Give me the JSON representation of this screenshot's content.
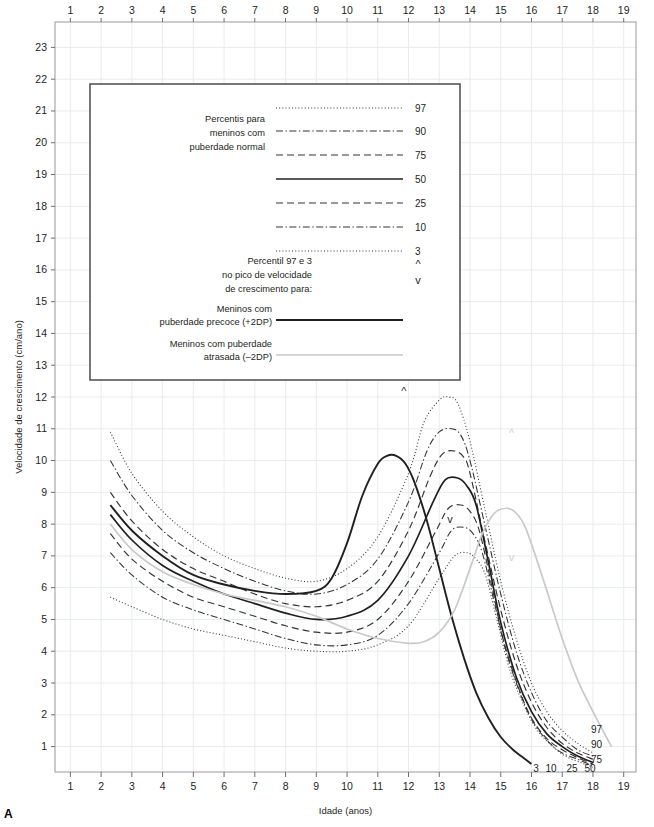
{
  "figure": {
    "panel_label": "A"
  },
  "axes": {
    "x": {
      "title": "Idade (anos)",
      "ticks": [
        1,
        2,
        3,
        4,
        5,
        6,
        7,
        8,
        9,
        10,
        11,
        12,
        13,
        14,
        15,
        16,
        17,
        18,
        19
      ],
      "min": 0.5,
      "max": 19.4
    },
    "y": {
      "title": "Velocidade de crescimento (cm/ano)",
      "ticks": [
        23,
        22,
        21,
        20,
        19,
        18,
        17,
        16,
        15,
        14,
        13,
        12,
        11,
        10,
        9,
        8,
        7,
        6,
        5,
        4,
        3,
        2,
        1
      ],
      "min": 0.2,
      "max": 23.8
    },
    "grid": true
  },
  "legend": {
    "title_normal": "Percentis para\nmeninos com\npuberdade normal",
    "title_normal_lines": [
      "Percentis para",
      "meninos com",
      "puberdade normal"
    ],
    "entries": [
      {
        "label": "97",
        "style": "dotted"
      },
      {
        "label": "90",
        "style": "dash-dot"
      },
      {
        "label": "75",
        "style": "dashed"
      },
      {
        "label": "50",
        "style": "solid"
      },
      {
        "label": "25",
        "style": "dashed"
      },
      {
        "label": "10",
        "style": "dash-dot"
      },
      {
        "label": "3",
        "style": "dotted"
      }
    ],
    "peak_title_lines": [
      "Percentil 97 e 3",
      "no pico de velocidade",
      "de crescimento para:"
    ],
    "peak_markers": {
      "up": "^",
      "down": "v"
    },
    "precoce_lines": [
      "Meninos com",
      "puberdade precoce (+2DP)"
    ],
    "atrasada_lines": [
      "Meninos com puberdade",
      "atrasada (–2DP)"
    ]
  },
  "curve_end_labels": {
    "right_stack": [
      "97",
      "90",
      "75"
    ],
    "bottom_row": [
      "3",
      "10",
      "25",
      "50"
    ]
  },
  "markers": [
    {
      "name": "precoce-97-up",
      "glyph": "^",
      "x": 11.85,
      "y": 12.05,
      "color": "#231f20"
    },
    {
      "name": "precoce-3-down",
      "glyph": "v",
      "x": 13.35,
      "y": 8.05,
      "color": "#231f20"
    },
    {
      "name": "atrasada-97-up",
      "glyph": "^",
      "x": 15.35,
      "y": 10.75,
      "color": "#cfcfcf"
    },
    {
      "name": "atrasada-3-down",
      "glyph": "v",
      "x": 15.35,
      "y": 6.85,
      "color": "#cfcfcf"
    }
  ],
  "colors": {
    "percentile": "#333333",
    "median": "#231f20",
    "precoce": "#231f20",
    "atrasada": "#c9c9c9",
    "grid": "#e9ecee",
    "frame": "#9a9a9a"
  },
  "chart_data": {
    "type": "line",
    "xlabel": "Idade (anos)",
    "ylabel": "Velocidade de crescimento (cm/ano)",
    "xlim": [
      0.5,
      19.4
    ],
    "ylim": [
      0.2,
      23.8
    ],
    "grid": true,
    "legend_position": "inset-top-left",
    "x_ticks": [
      1,
      2,
      3,
      4,
      5,
      6,
      7,
      8,
      9,
      10,
      11,
      12,
      13,
      14,
      15,
      16,
      17,
      18,
      19
    ],
    "y_ticks": [
      1,
      2,
      3,
      4,
      5,
      6,
      7,
      8,
      9,
      10,
      11,
      12,
      13,
      14,
      15,
      16,
      17,
      18,
      19,
      20,
      21,
      22,
      23
    ],
    "series": [
      {
        "name": "97",
        "style": "dotted",
        "x": [
          2.3,
          3,
          4,
          5,
          6,
          7,
          8,
          9,
          10,
          11,
          12,
          12.5,
          13,
          13.3,
          13.6,
          14,
          14.5,
          15,
          15.5,
          16,
          16.5,
          17,
          17.5,
          18
        ],
        "values": [
          10.9,
          9.6,
          8.4,
          7.6,
          7.0,
          6.6,
          6.3,
          6.2,
          6.6,
          7.6,
          9.6,
          11.2,
          11.9,
          12.0,
          11.8,
          10.6,
          8.4,
          6.2,
          4.4,
          3.0,
          2.1,
          1.5,
          1.1,
          0.8
        ]
      },
      {
        "name": "90",
        "style": "dash-dot",
        "x": [
          2.3,
          3,
          4,
          5,
          6,
          7,
          8,
          9,
          10,
          11,
          12,
          12.6,
          13,
          13.4,
          13.7,
          14,
          14.5,
          15,
          15.5,
          16,
          16.5,
          17,
          17.5,
          18
        ],
        "values": [
          10.0,
          8.9,
          7.8,
          7.1,
          6.6,
          6.2,
          5.9,
          5.8,
          6.1,
          6.9,
          8.7,
          10.3,
          10.9,
          11.0,
          10.8,
          10.0,
          7.9,
          5.8,
          4.0,
          2.7,
          1.8,
          1.3,
          0.9,
          0.7
        ]
      },
      {
        "name": "75",
        "style": "dashed",
        "x": [
          2.3,
          3,
          4,
          5,
          6,
          7,
          8,
          9,
          10,
          11,
          12,
          12.7,
          13.1,
          13.5,
          13.8,
          14,
          14.5,
          15,
          15.5,
          16,
          16.5,
          17,
          17.5,
          18
        ],
        "values": [
          9.0,
          8.1,
          7.2,
          6.6,
          6.2,
          5.8,
          5.5,
          5.4,
          5.6,
          6.2,
          7.8,
          9.5,
          10.2,
          10.3,
          10.1,
          9.6,
          7.4,
          5.3,
          3.6,
          2.4,
          1.6,
          1.1,
          0.8,
          0.6
        ]
      },
      {
        "name": "50",
        "style": "solid",
        "x": [
          2.3,
          3,
          4,
          5,
          6,
          7,
          8,
          9,
          10,
          11,
          12,
          12.8,
          13.2,
          13.6,
          13.9,
          14.2,
          14.6,
          15,
          15.5,
          16,
          16.5,
          17,
          17.5,
          18
        ],
        "values": [
          8.3,
          7.5,
          6.7,
          6.2,
          5.8,
          5.5,
          5.2,
          5.0,
          5.1,
          5.6,
          7.0,
          8.7,
          9.4,
          9.45,
          9.2,
          8.6,
          6.8,
          4.9,
          3.2,
          2.1,
          1.4,
          1.0,
          0.7,
          0.5
        ]
      },
      {
        "name": "25",
        "style": "dashed",
        "x": [
          2.3,
          3,
          4,
          5,
          6,
          7,
          8,
          9,
          10,
          11,
          12,
          12.9,
          13.3,
          13.7,
          14,
          14.3,
          14.7,
          15.1,
          15.6,
          16,
          16.5,
          17,
          17.5,
          18
        ],
        "values": [
          7.7,
          6.9,
          6.2,
          5.7,
          5.4,
          5.1,
          4.8,
          4.6,
          4.6,
          5.0,
          6.2,
          7.8,
          8.5,
          8.6,
          8.4,
          7.8,
          6.1,
          4.3,
          2.8,
          1.9,
          1.25,
          0.9,
          0.65,
          0.45
        ]
      },
      {
        "name": "10",
        "style": "dash-dot",
        "x": [
          2.3,
          3,
          4,
          5,
          6,
          7,
          8,
          9,
          10,
          11,
          12,
          13,
          13.4,
          13.8,
          14.1,
          14.4,
          14.8,
          15.2,
          15.7,
          16.1,
          16.6,
          17,
          17.5,
          18
        ],
        "values": [
          7.1,
          6.4,
          5.7,
          5.3,
          5.0,
          4.7,
          4.4,
          4.2,
          4.2,
          4.5,
          5.5,
          7.1,
          7.8,
          7.9,
          7.7,
          7.1,
          5.5,
          3.9,
          2.5,
          1.7,
          1.1,
          0.8,
          0.6,
          0.4
        ]
      },
      {
        "name": "3",
        "style": "dotted",
        "x": [
          2.3,
          3,
          4,
          5,
          6,
          7,
          8,
          9,
          10,
          11,
          12,
          13,
          13.5,
          13.9,
          14.2,
          14.5,
          14.9,
          15.3,
          15.8,
          16.2,
          16.7,
          17.1,
          17.6,
          18
        ],
        "values": [
          5.7,
          5.4,
          5.0,
          4.7,
          4.5,
          4.3,
          4.1,
          4.0,
          4.0,
          4.2,
          4.8,
          6.3,
          7.0,
          7.1,
          6.9,
          6.4,
          4.9,
          3.4,
          2.2,
          1.5,
          1.0,
          0.7,
          0.5,
          0.35
        ]
      },
      {
        "name": "puberdade precoce (+2DP)",
        "style": "solid-dark",
        "x": [
          2.3,
          3,
          4,
          5,
          6,
          7,
          8,
          9,
          9.5,
          10,
          10.5,
          11,
          11.3,
          11.6,
          11.9,
          12.2,
          12.6,
          13,
          13.4,
          13.8,
          14.2,
          14.6,
          15,
          15.4,
          15.8,
          16
        ],
        "values": [
          8.6,
          7.8,
          7.0,
          6.4,
          6.1,
          5.9,
          5.8,
          5.9,
          6.3,
          7.4,
          8.9,
          9.9,
          10.15,
          10.15,
          9.9,
          9.3,
          8.1,
          6.6,
          5.1,
          3.8,
          2.7,
          1.9,
          1.3,
          0.9,
          0.6,
          0.45
        ]
      },
      {
        "name": "puberdade atrasada (–2DP)",
        "style": "gray",
        "x": [
          2.3,
          3,
          4,
          5,
          6,
          7,
          8,
          9,
          10,
          11,
          12,
          12.5,
          13,
          13.5,
          14,
          14.4,
          14.8,
          15.2,
          15.5,
          15.8,
          16.2,
          16.6,
          17,
          17.5,
          18,
          18.6
        ],
        "values": [
          8.0,
          7.2,
          6.5,
          6.1,
          5.8,
          5.6,
          5.4,
          5.1,
          4.7,
          4.4,
          4.25,
          4.3,
          4.6,
          5.3,
          6.6,
          7.7,
          8.35,
          8.5,
          8.35,
          7.9,
          6.8,
          5.6,
          4.4,
          3.1,
          2.1,
          1.0
        ]
      }
    ],
    "annotations": [
      {
        "text": "^",
        "x": 11.85,
        "y": 12.05,
        "meaning": "percentil 97 no pico, puberdade precoce"
      },
      {
        "text": "v",
        "x": 13.35,
        "y": 8.05,
        "meaning": "percentil 3 no pico, puberdade precoce"
      },
      {
        "text": "^",
        "x": 15.35,
        "y": 10.75,
        "meaning": "percentil 97 no pico, puberdade atrasada"
      },
      {
        "text": "v",
        "x": 15.35,
        "y": 6.85,
        "meaning": "percentil 3 no pico, puberdade atrasada"
      }
    ]
  }
}
